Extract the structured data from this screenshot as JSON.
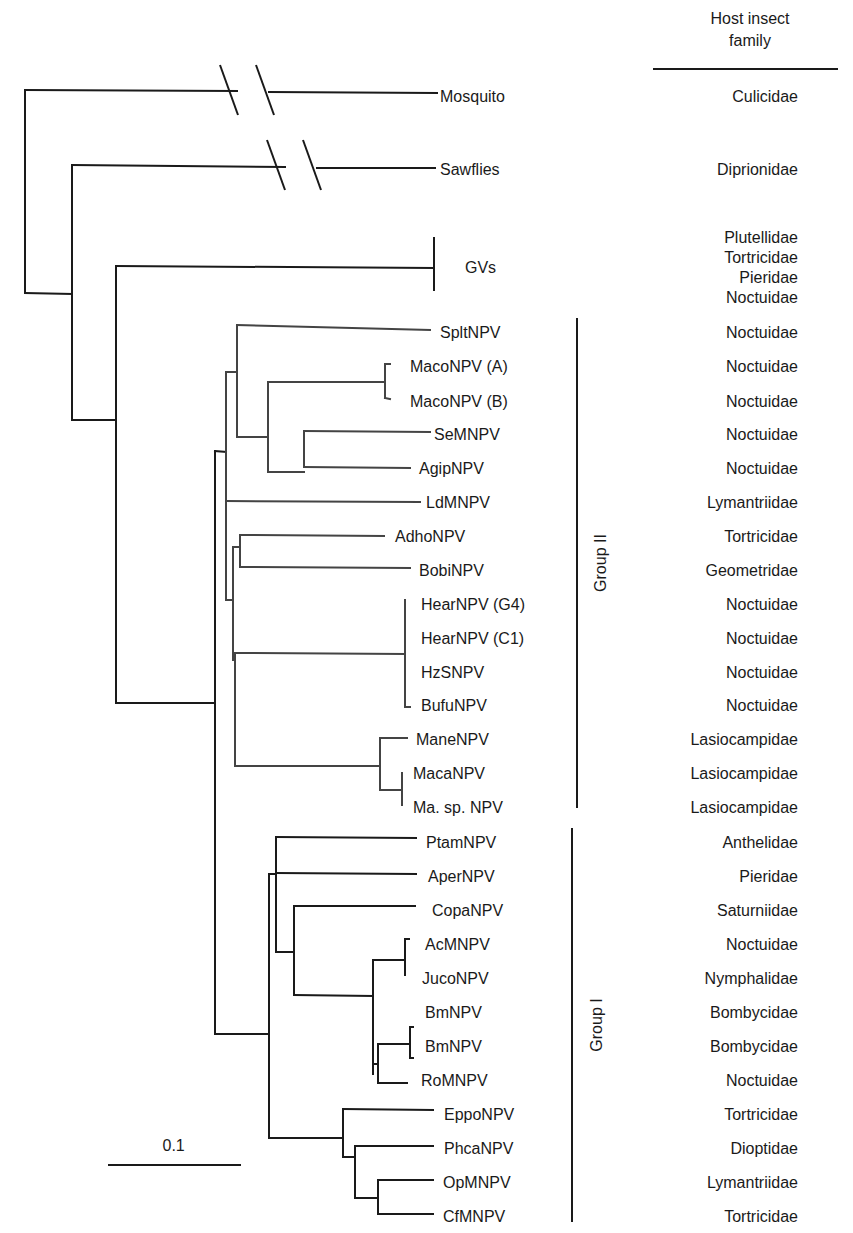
{
  "header": {
    "line1": "Host insect",
    "line2": "family"
  },
  "scale_bar": {
    "label": "0.1",
    "x1": 108,
    "x2": 241,
    "y": 1165
  },
  "groups": [
    {
      "label": "Group II",
      "x": 577,
      "y1": 318,
      "y2": 808,
      "label_y": 563
    },
    {
      "label": "Group I",
      "x": 572,
      "y1": 828,
      "y2": 1222,
      "label_y": 1025
    }
  ],
  "taxa": [
    {
      "name": "Mosquito",
      "x": 440,
      "y": 97,
      "family": "Culicidae"
    },
    {
      "name": "Sawflies",
      "x": 440,
      "y": 170,
      "family": "Diprionidae"
    },
    {
      "name": "GVs",
      "x": 465,
      "y": 268,
      "family": "Plutellidae\nTortricidae\nPieridae\nNoctuidae"
    },
    {
      "name": "SpltNPV",
      "x": 440,
      "y": 333,
      "family": "Noctuidae"
    },
    {
      "name": "MacoNPV (A)",
      "x": 410,
      "y": 367,
      "family": "Noctuidae"
    },
    {
      "name": "MacoNPV (B)",
      "x": 410,
      "y": 402,
      "family": "Noctuidae"
    },
    {
      "name": "SeMNPV",
      "x": 434,
      "y": 435,
      "family": "Noctuidae"
    },
    {
      "name": "AgipNPV",
      "x": 419,
      "y": 469,
      "family": "Noctuidae"
    },
    {
      "name": "LdMNPV",
      "x": 426,
      "y": 503,
      "family": "Lymantriidae"
    },
    {
      "name": "AdhoNPV",
      "x": 395,
      "y": 537,
      "family": "Tortricidae"
    },
    {
      "name": "BobiNPV",
      "x": 419,
      "y": 571,
      "family": "Geometridae"
    },
    {
      "name": "HearNPV (G4)",
      "x": 421,
      "y": 605,
      "family": "Noctuidae"
    },
    {
      "name": "HearNPV (C1)",
      "x": 421,
      "y": 639,
      "family": "Noctuidae"
    },
    {
      "name": "HzSNPV",
      "x": 421,
      "y": 673,
      "family": "Noctuidae"
    },
    {
      "name": "BufuNPV",
      "x": 421,
      "y": 706,
      "family": "Noctuidae"
    },
    {
      "name": "ManeNPV",
      "x": 416,
      "y": 740,
      "family": "Lasiocampidae"
    },
    {
      "name": "MacaNPV",
      "x": 413,
      "y": 774,
      "family": "Lasiocampidae"
    },
    {
      "name": "Ma. sp. NPV",
      "x": 413,
      "y": 808,
      "family": "Lasiocampidae"
    },
    {
      "name": "PtamNPV",
      "x": 426,
      "y": 843,
      "family": "Anthelidae"
    },
    {
      "name": "AperNPV",
      "x": 428,
      "y": 877,
      "family": "Pieridae"
    },
    {
      "name": "CopaNPV",
      "x": 432,
      "y": 911,
      "family": "Saturniidae"
    },
    {
      "name": "AcMNPV",
      "x": 425,
      "y": 945,
      "family": "Noctuidae"
    },
    {
      "name": "JucoNPV",
      "x": 422,
      "y": 979,
      "family": "Nymphalidae"
    },
    {
      "name": "BmNPV",
      "x": 425,
      "y": 1013,
      "family": "Bombycidae"
    },
    {
      "name": "BmNPV",
      "x": 425,
      "y": 1047,
      "family": "Bombycidae"
    },
    {
      "name": "RoMNPV",
      "x": 421,
      "y": 1081,
      "family": "Noctuidae"
    },
    {
      "name": "EppoNPV",
      "x": 444,
      "y": 1115,
      "family": "Tortricidae"
    },
    {
      "name": "PhcaNPV",
      "x": 444,
      "y": 1149,
      "family": "Dioptidae"
    },
    {
      "name": "OpMNPV",
      "x": 443,
      "y": 1183,
      "family": "Lymantriidae"
    },
    {
      "name": "CfMNPV",
      "x": 443,
      "y": 1217,
      "family": "Tortricidae"
    }
  ],
  "branches": [
    [
      25,
      90,
      25,
      293
    ],
    [
      25,
      90,
      237,
      91
    ],
    [
      269,
      92,
      437,
      93
    ],
    [
      25,
      293,
      72,
      294
    ],
    [
      72,
      165,
      72,
      420
    ],
    [
      72,
      165,
      285,
      167
    ],
    [
      317,
      168,
      435,
      168
    ],
    [
      72,
      420,
      116,
      420
    ],
    [
      116,
      266,
      116,
      703
    ],
    [
      116,
      266,
      434,
      268
    ],
    [
      434,
      238,
      434,
      290
    ],
    [
      116,
      703,
      215,
      703
    ],
    [
      215,
      451,
      215,
      1034
    ],
    [
      215,
      451,
      226,
      452
    ],
    [
      226,
      372,
      226,
      600
    ],
    [
      226,
      372,
      237,
      372
    ],
    [
      237,
      325,
      237,
      437
    ],
    [
      237,
      325,
      430,
      330
    ],
    [
      237,
      437,
      268,
      437
    ],
    [
      268,
      382,
      268,
      472
    ],
    [
      268,
      382,
      385,
      382
    ],
    [
      385,
      364,
      385,
      398
    ],
    [
      385,
      364,
      390,
      364
    ],
    [
      385,
      398,
      390,
      399
    ],
    [
      268,
      472,
      304,
      472
    ],
    [
      304,
      431,
      304,
      467
    ],
    [
      304,
      431,
      430,
      432
    ],
    [
      304,
      467,
      410,
      468
    ],
    [
      226,
      501,
      420,
      502
    ],
    [
      226,
      600,
      233,
      600
    ],
    [
      233,
      547,
      233,
      660
    ],
    [
      233,
      547,
      240,
      547
    ],
    [
      240,
      535,
      240,
      567
    ],
    [
      240,
      535,
      384,
      536
    ],
    [
      240,
      567,
      410,
      568
    ],
    [
      233,
      660,
      235,
      660
    ],
    [
      235,
      653,
      235,
      766
    ],
    [
      235,
      653,
      405,
      654
    ],
    [
      405,
      600,
      405,
      707
    ],
    [
      405,
      707,
      410,
      707
    ],
    [
      235,
      766,
      380,
      766
    ],
    [
      380,
      738,
      380,
      790
    ],
    [
      380,
      738,
      407,
      738
    ],
    [
      380,
      790,
      402,
      790
    ],
    [
      402,
      773,
      402,
      805
    ],
    [
      215,
      1034,
      269,
      1034
    ],
    [
      269,
      874,
      269,
      1138
    ],
    [
      269,
      874,
      276,
      874
    ],
    [
      276,
      837,
      276,
      952
    ],
    [
      276,
      837,
      416,
      838
    ],
    [
      276,
      873,
      416,
      874
    ],
    [
      276,
      952,
      294,
      952
    ],
    [
      294,
      906,
      294,
      995
    ],
    [
      294,
      906,
      415,
      906
    ],
    [
      294,
      995,
      373,
      996
    ],
    [
      373,
      960,
      373,
      1074
    ],
    [
      373,
      960,
      405,
      960
    ],
    [
      405,
      939,
      405,
      975
    ],
    [
      405,
      939,
      409,
      939
    ],
    [
      373,
      1064,
      378,
      1064
    ],
    [
      378,
      1044,
      378,
      1083
    ],
    [
      378,
      1044,
      410,
      1044
    ],
    [
      410,
      1027,
      410,
      1058
    ],
    [
      410,
      1027,
      413,
      1027
    ],
    [
      410,
      1058,
      413,
      1058
    ],
    [
      378,
      1083,
      407,
      1083
    ],
    [
      269,
      1138,
      343,
      1138
    ],
    [
      343,
      1109,
      343,
      1157
    ],
    [
      343,
      1109,
      433,
      1110
    ],
    [
      343,
      1157,
      355,
      1157
    ],
    [
      355,
      1146,
      355,
      1198
    ],
    [
      355,
      1146,
      433,
      1146
    ],
    [
      355,
      1198,
      378,
      1198
    ],
    [
      378,
      1180,
      378,
      1214
    ],
    [
      378,
      1180,
      433,
      1180
    ],
    [
      378,
      1214,
      433,
      1214
    ]
  ],
  "breaks": [
    [
      220,
      65,
      238,
      115
    ],
    [
      256,
      65,
      274,
      115
    ],
    [
      267,
      140,
      285,
      190
    ],
    [
      303,
      140,
      321,
      190
    ]
  ],
  "colors": {
    "line": "#1a1a1a",
    "inner_line": "#444444"
  }
}
